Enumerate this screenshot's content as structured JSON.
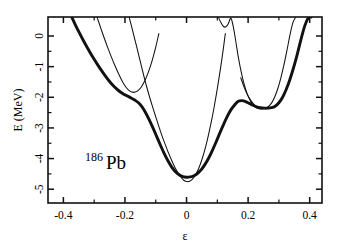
{
  "chart_data": {
    "type": "line",
    "title": "",
    "xlabel": "ε",
    "ylabel": "E (MeV)",
    "xlim": [
      -0.45,
      0.44
    ],
    "ylim": [
      -5.45,
      0.62
    ],
    "grid": false,
    "legend_position": "none",
    "annotations": [
      {
        "name": "nuclide-label",
        "superscript": "186",
        "text": "Pb",
        "x": -0.33,
        "y": -4.35
      }
    ],
    "xticks_major": [
      -0.4,
      -0.2,
      0.0,
      0.2,
      0.4
    ],
    "xticklabels": [
      "-0.4",
      "-0.2",
      "0",
      "0.2",
      "0.4"
    ],
    "xticks_minor": [
      -0.3,
      -0.1,
      0.1,
      0.3
    ],
    "yticks_major": [
      0,
      -1,
      -2,
      -3,
      -4,
      -5
    ],
    "yticklabels": [
      "0",
      "-1",
      "-2",
      "-3",
      "-4",
      "-5"
    ],
    "yticks_minor": [
      -0.5,
      -1.5,
      -2.5,
      -3.5,
      -4.5
    ],
    "series": [
      {
        "name": "adiabatic-envelope",
        "style": "thick",
        "description": "Lowest adiabatic potential energy surface (thick bold line)",
        "x": [
          -0.372,
          -0.36,
          -0.348,
          -0.336,
          -0.324,
          -0.312,
          -0.3,
          -0.288,
          -0.276,
          -0.264,
          -0.252,
          -0.24,
          -0.228,
          -0.216,
          -0.204,
          -0.192,
          -0.18,
          -0.168,
          -0.156,
          -0.144,
          -0.132,
          -0.12,
          -0.108,
          -0.096,
          -0.084,
          -0.072,
          -0.06,
          -0.048,
          -0.036,
          -0.024,
          -0.012,
          0.0,
          0.012,
          0.024,
          0.036,
          0.048,
          0.06,
          0.072,
          0.084,
          0.096,
          0.108,
          0.12,
          0.132,
          0.144,
          0.156,
          0.168,
          0.18,
          0.192,
          0.204,
          0.216,
          0.228,
          0.24,
          0.252,
          0.264,
          0.276,
          0.288,
          0.3,
          0.312,
          0.324,
          0.336,
          0.348,
          0.36,
          0.372,
          0.384,
          0.396,
          0.405
        ],
        "y": [
          0.6,
          0.34,
          0.1,
          -0.13,
          -0.35,
          -0.56,
          -0.76,
          -0.95,
          -1.13,
          -1.3,
          -1.46,
          -1.6,
          -1.72,
          -1.82,
          -1.9,
          -1.96,
          -2.02,
          -2.09,
          -2.18,
          -2.32,
          -2.52,
          -2.76,
          -3.02,
          -3.3,
          -3.58,
          -3.85,
          -4.08,
          -4.28,
          -4.43,
          -4.53,
          -4.59,
          -4.61,
          -4.6,
          -4.56,
          -4.48,
          -4.36,
          -4.19,
          -3.98,
          -3.73,
          -3.46,
          -3.17,
          -2.89,
          -2.63,
          -2.41,
          -2.25,
          -2.13,
          -2.11,
          -2.14,
          -2.2,
          -2.26,
          -2.31,
          -2.34,
          -2.355,
          -2.355,
          -2.34,
          -2.29,
          -2.18,
          -2.0,
          -1.74,
          -1.41,
          -1.02,
          -0.58,
          -0.1,
          0.33,
          0.6,
          0.62
        ]
      },
      {
        "name": "branch-left-outer",
        "style": "thin",
        "description": "Diabatic branch entering top-left, crossing the envelope near eps=-0.19",
        "x": [
          -0.29,
          -0.28,
          -0.268,
          -0.256,
          -0.244,
          -0.232,
          -0.22,
          -0.208,
          -0.196,
          -0.184,
          -0.172,
          -0.16,
          -0.148,
          -0.136,
          -0.124,
          -0.112,
          -0.1,
          -0.09
        ],
        "y": [
          0.6,
          0.3,
          -0.05,
          -0.38,
          -0.69,
          -0.98,
          -1.25,
          -1.49,
          -1.68,
          -1.8,
          -1.84,
          -1.8,
          -1.68,
          -1.47,
          -1.18,
          -0.81,
          -0.36,
          0.08
        ]
      },
      {
        "name": "branch-left-inner",
        "style": "thin",
        "description": "Steep diabatic branch crossing the envelope on the left flank near eps=-0.15",
        "x": [
          -0.186,
          -0.178,
          -0.17,
          -0.162,
          -0.154,
          -0.146,
          -0.138,
          -0.13,
          -0.12,
          -0.11,
          -0.1,
          -0.09,
          -0.08,
          -0.07,
          -0.06,
          -0.05,
          -0.04,
          -0.03,
          -0.02,
          -0.01,
          0.0,
          0.01,
          0.02,
          0.03,
          0.04,
          0.05,
          0.06,
          0.07,
          0.08,
          0.09,
          0.1,
          0.11,
          0.12,
          0.126
        ],
        "y": [
          0.6,
          0.29,
          -0.03,
          -0.35,
          -0.68,
          -1.01,
          -1.33,
          -1.64,
          -1.99,
          -2.32,
          -2.64,
          -2.95,
          -3.25,
          -3.52,
          -3.78,
          -4.02,
          -4.24,
          -4.43,
          -4.58,
          -4.7,
          -4.75,
          -4.74,
          -4.66,
          -4.52,
          -4.31,
          -4.03,
          -3.69,
          -3.28,
          -2.82,
          -2.3,
          -1.72,
          -1.08,
          -0.38,
          0.08
        ]
      },
      {
        "name": "branch-right-sharp",
        "style": "thin",
        "description": "Sharp V-shaped diabatic branch with apex at top near eps=0.145",
        "x": [
          0.104,
          0.112,
          0.12,
          0.128,
          0.136,
          0.144,
          0.152,
          0.16,
          0.168,
          0.176,
          0.184,
          0.192,
          0.2,
          0.208,
          0.216,
          0.224,
          0.232,
          0.24,
          0.248,
          0.256,
          0.262
        ],
        "y": [
          0.6,
          0.43,
          0.31,
          0.3,
          0.41,
          0.58,
          0.3,
          -0.18,
          -0.68,
          -1.1,
          -1.46,
          -1.74,
          -1.96,
          -2.13,
          -2.26,
          -2.33,
          -2.37,
          -2.38,
          -2.37,
          -2.36,
          -2.35
        ]
      },
      {
        "name": "branch-right-outer",
        "style": "thin",
        "description": "Diabatic branch forming the right-hand secondary minimum near eps=0.26",
        "x": [
          0.176,
          0.186,
          0.196,
          0.206,
          0.216,
          0.226,
          0.236,
          0.246,
          0.256,
          0.266,
          0.276,
          0.286,
          0.296,
          0.306,
          0.316,
          0.326,
          0.336,
          0.346,
          0.354
        ],
        "y": [
          -1.36,
          -1.64,
          -1.88,
          -2.06,
          -2.2,
          -2.3,
          -2.35,
          -2.37,
          -2.355,
          -2.3,
          -2.19,
          -2.0,
          -1.73,
          -1.38,
          -0.96,
          -0.48,
          0.04,
          0.45,
          0.6
        ]
      }
    ]
  },
  "axes": {
    "x_title": "ε",
    "y_title": "E (MeV)"
  }
}
